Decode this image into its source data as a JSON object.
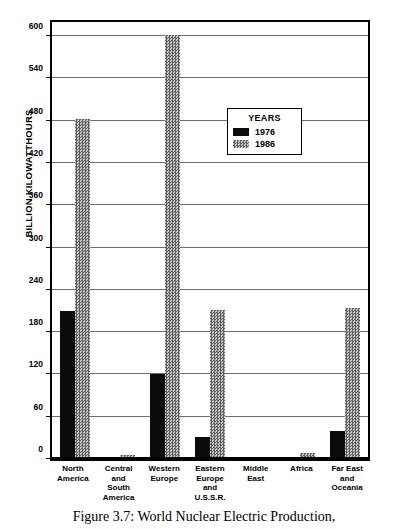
{
  "figure": {
    "caption": "Figure 3.7: World Nuclear Electric Production,"
  },
  "legend": {
    "title": "YEARS",
    "entries": [
      {
        "label": "1976",
        "color": "#0b0b0b",
        "pattern": "solid"
      },
      {
        "label": "1986",
        "color": "#9a9a9a",
        "pattern": "checker"
      }
    ]
  },
  "chart_data": {
    "type": "bar",
    "title": "Figure 3.7: World Nuclear Electric Production,",
    "xlabel": "",
    "ylabel": "BILLION KILOWATTHOURS",
    "ylim": [
      0,
      620
    ],
    "yticks": [
      0,
      60,
      120,
      180,
      240,
      300,
      360,
      420,
      480,
      540,
      600
    ],
    "ytick_labels": [
      "0",
      "60",
      "120",
      "180",
      "240",
      "300",
      "360",
      "420",
      "480",
      "540",
      "600"
    ],
    "grid": true,
    "legend_position": "inside-upper-center",
    "categories": [
      [
        "North",
        "America"
      ],
      [
        "Central",
        "and",
        "South",
        "America"
      ],
      [
        "Western",
        "Europe"
      ],
      [
        "Eastern",
        "Europe",
        "and",
        "U.S.S.R."
      ],
      [
        "Middle",
        "East"
      ],
      [
        "Africa"
      ],
      [
        "Far East",
        "and",
        "Oceania"
      ]
    ],
    "category_names": [
      "North America",
      "Central and South America",
      "Western Europe",
      "Eastern Europe and U.S.S.R.",
      "Middle East",
      "Africa",
      "Far East and Oceania"
    ],
    "series": [
      {
        "name": "1976",
        "color": "#0b0b0b",
        "values": [
          210,
          2,
          120,
          31,
          0,
          0,
          40
        ]
      },
      {
        "name": "1986",
        "color": "#9a9a9a",
        "values": [
          483,
          6,
          602,
          212,
          0,
          9,
          214
        ]
      }
    ]
  }
}
